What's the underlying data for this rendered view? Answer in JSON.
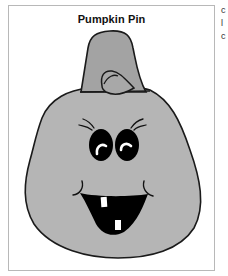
{
  "page": {
    "title": "Pumpkin Pin",
    "clipped_edge_text": [
      "c",
      "l",
      "c"
    ]
  },
  "illustration": {
    "subject": "pumpkin face",
    "body_color": "#b5b5b5",
    "stem_color": "#a3a3a3",
    "outline_color": "#1a1a1a",
    "feature_color": "#000000",
    "highlight_color": "#ffffff",
    "teeth_count": 2
  }
}
